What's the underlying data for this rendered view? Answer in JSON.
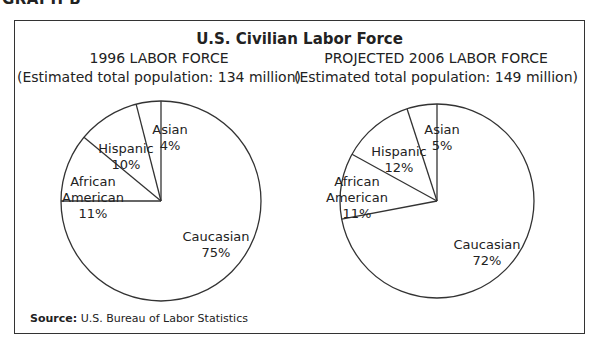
{
  "header": {
    "graph_label": "GRAPH B",
    "title": "U.S. Civilian Labor Force",
    "source_label": "Source:",
    "source_text": "U.S. Bureau of Labor Statistics"
  },
  "left_chart": {
    "title_line1": "1996 LABOR FORCE",
    "title_line2": "(Estimated total population: 134 million)"
  },
  "right_chart": {
    "title_line1": "PROJECTED 2006 LABOR FORCE",
    "title_line2": "(Estimated total population: 149 million)"
  },
  "chart_data": [
    {
      "type": "pie",
      "title": "1996 LABOR FORCE",
      "subtitle": "(Estimated total population: 134 million)",
      "categories": [
        "Asian",
        "Hispanic",
        "African American",
        "Caucasian"
      ],
      "values": [
        4,
        10,
        11,
        75
      ],
      "labels": [
        "Asian 4%",
        "Hispanic 10%",
        "African American 11%",
        "Caucasian 75%"
      ]
    },
    {
      "type": "pie",
      "title": "PROJECTED 2006 LABOR FORCE",
      "subtitle": "(Estimated total population: 149 million)",
      "categories": [
        "Asian",
        "Hispanic",
        "African American",
        "Caucasian"
      ],
      "values": [
        5,
        12,
        11,
        72
      ],
      "labels": [
        "Asian 5%",
        "Hispanic 12%",
        "African American 11%",
        "Caucasian 72%"
      ]
    }
  ]
}
